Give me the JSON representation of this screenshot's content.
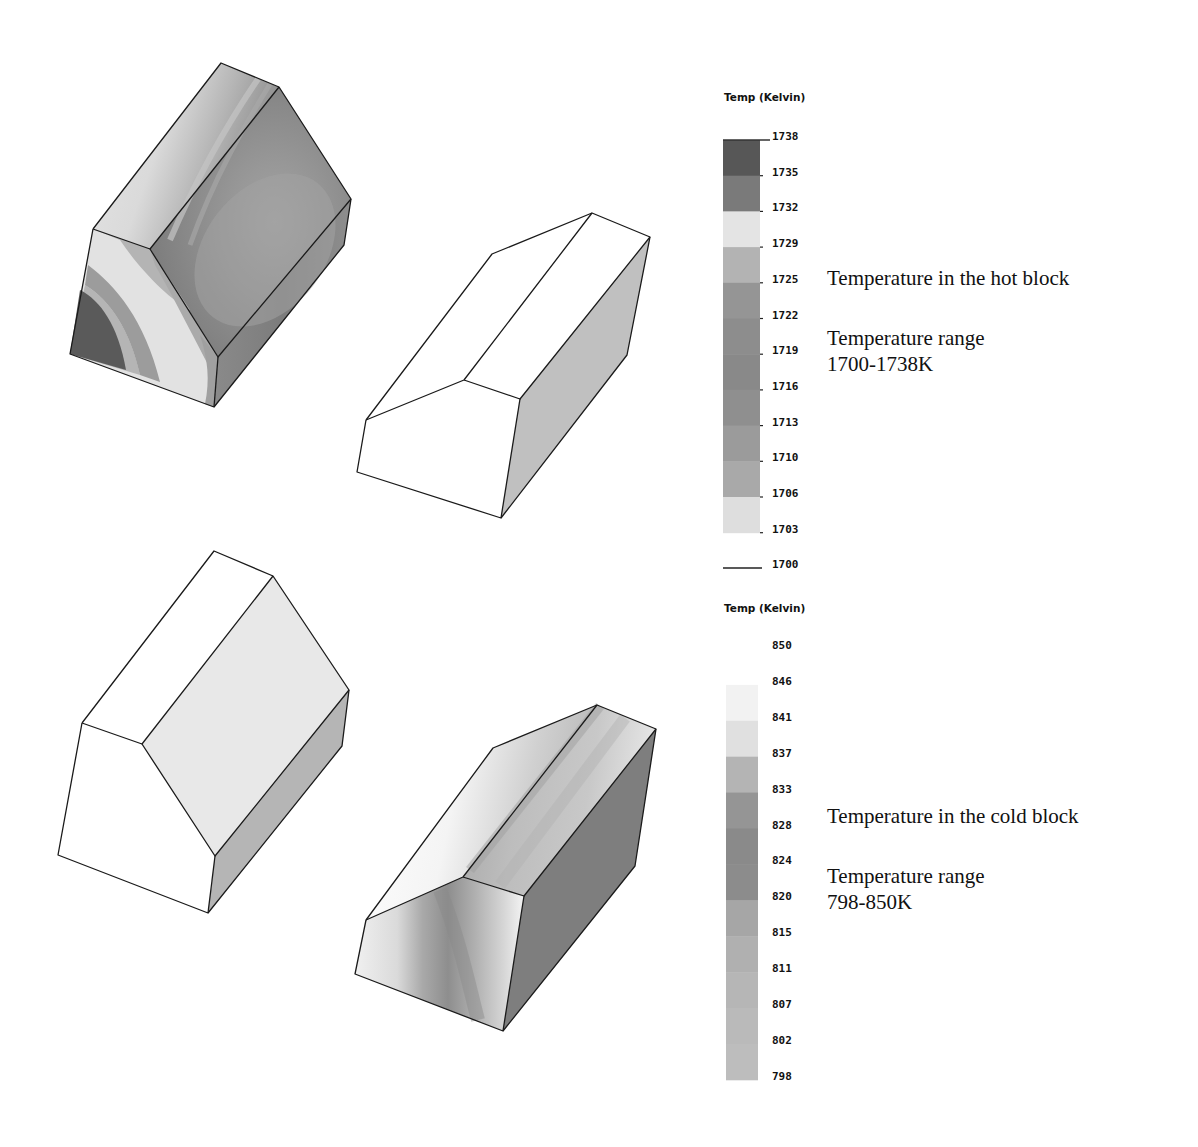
{
  "hot_block": {
    "caption_title": "Temperature in the hot block",
    "caption_range_label": "Temperature range",
    "caption_range_value": "1700-1738K",
    "legend": {
      "title": "Temp (Kelvin)",
      "ticks": [
        "1738",
        "1735",
        "1732",
        "1729",
        "1725",
        "1722",
        "1719",
        "1716",
        "1713",
        "1710",
        "1706",
        "1703",
        "1700"
      ],
      "band_colors": [
        "#575757",
        "#7a7a7a",
        "#e4e4e4",
        "#b3b3b3",
        "#959595",
        "#8d8d8d",
        "#898989",
        "#8f8f8f",
        "#9b9b9b",
        "#a9a9a9",
        "#dedede"
      ]
    }
  },
  "cold_block": {
    "caption_title": "Temperature in the cold block",
    "caption_range_label": "Temperature range",
    "caption_range_value": "798-850K",
    "legend": {
      "title": "Temp (Kelvin)",
      "ticks": [
        "850",
        "846",
        "841",
        "837",
        "833",
        "828",
        "824",
        "820",
        "815",
        "811",
        "807",
        "802",
        "798"
      ],
      "band_colors": [
        "#f2f2f2",
        "#e0e0e0",
        "#b4b4b4",
        "#959595",
        "#8a8a8a",
        "#8c8c8c",
        "#a6a6a6",
        "#b0b0b0",
        "#b6b6b6",
        "#bababa",
        "#bdbdbd"
      ]
    }
  },
  "views": [
    {
      "id": "hot-block-front-view",
      "description": "Hot block, front view, contoured"
    },
    {
      "id": "hot-block-back-view",
      "description": "Hot block, rear view, mostly uniform"
    },
    {
      "id": "cold-block-front-view",
      "description": "Cold block, front view, mostly uniform"
    },
    {
      "id": "cold-block-back-view",
      "description": "Cold block, rear view, contoured"
    }
  ],
  "chart_data": [
    {
      "type": "heatmap",
      "title": "Temperature in the hot block",
      "legend_title": "Temp (Kelvin)",
      "range": [
        1700,
        1738
      ],
      "unit": "K",
      "legend_levels": [
        1738,
        1735,
        1732,
        1729,
        1725,
        1722,
        1719,
        1716,
        1713,
        1710,
        1706,
        1703,
        1700
      ]
    },
    {
      "type": "heatmap",
      "title": "Temperature in the cold block",
      "legend_title": "Temp (Kelvin)",
      "range": [
        798,
        850
      ],
      "unit": "K",
      "legend_levels": [
        850,
        846,
        841,
        837,
        833,
        828,
        824,
        820,
        815,
        811,
        807,
        802,
        798
      ]
    }
  ]
}
